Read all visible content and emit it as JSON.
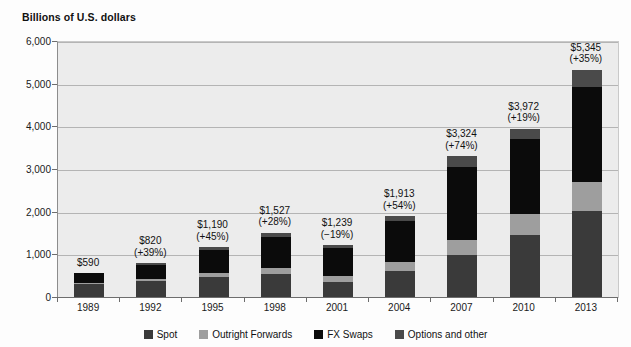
{
  "chart_data": {
    "type": "bar",
    "subtype": "stacked-bar",
    "title": "Billions of U.S. dollars",
    "xlabel": "",
    "ylabel": "",
    "ylim": [
      0,
      6000
    ],
    "yticks": [
      0,
      1000,
      2000,
      3000,
      4000,
      5000,
      6000
    ],
    "ytick_labels": [
      "0",
      "1,000",
      "2,000",
      "3,000",
      "4,000",
      "5,000",
      "6,000"
    ],
    "grid": true,
    "legend_position": "bottom",
    "categories": [
      "1989",
      "1992",
      "1995",
      "1998",
      "2001",
      "2004",
      "2007",
      "2010",
      "2013"
    ],
    "series": [
      {
        "name": "Spot",
        "color": "#3a3a3a",
        "values": [
          317,
          394,
          494,
          568,
          387,
          631,
          1005,
          1488,
          2046
        ]
      },
      {
        "name": "Outright Forwards",
        "color": "#9e9e9e",
        "values": [
          27,
          58,
          97,
          128,
          131,
          209,
          362,
          475,
          680
        ]
      },
      {
        "name": "FX Swaps",
        "color": "#0b0b0b",
        "values": [
          246,
          324,
          546,
          734,
          656,
          954,
          1714,
          1759,
          2228
        ]
      },
      {
        "name": "Options and other",
        "color": "#4a4a4a",
        "values": [
          0,
          44,
          53,
          97,
          65,
          119,
          243,
          250,
          391
        ]
      }
    ],
    "totals": [
      590,
      820,
      1190,
      1527,
      1239,
      1913,
      3324,
      3972,
      5345
    ],
    "total_labels": [
      "$590",
      "$820",
      "$1,190",
      "$1,527",
      "$1,239",
      "$1,913",
      "$3,324",
      "$3,972",
      "$5,345"
    ],
    "growth_labels": [
      "",
      "(+39%)",
      "(+45%)",
      "(+28%)",
      "(−19%)",
      "(+54%)",
      "(+74%)",
      "(+19%)",
      "(+35%)"
    ]
  },
  "legend": {
    "items": [
      {
        "label": "Spot",
        "color": "#3a3a3a"
      },
      {
        "label": "Outright Forwards",
        "color": "#9e9e9e"
      },
      {
        "label": "FX Swaps",
        "color": "#0b0b0b"
      },
      {
        "label": "Options and other",
        "color": "#4a4a4a"
      }
    ]
  },
  "colors": {
    "plot_background": "#ececec",
    "gridline": "#b4b4b4",
    "axis": "#6d6d6d",
    "text": "#111111"
  }
}
